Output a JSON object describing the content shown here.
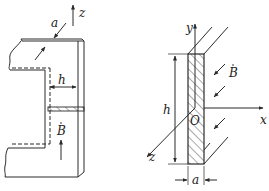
{
  "figure_left": {
    "labels": {
      "thickness": "a",
      "gap_width": "h",
      "field": "B",
      "axis_z": "z"
    },
    "description": "Magnetic core with air gap; hatched cross-section across right limb"
  },
  "figure_right": {
    "labels": {
      "axis_y": "y",
      "axis_x": "x",
      "axis_z": "z",
      "origin": "O",
      "height": "h",
      "width": "a",
      "field": "B"
    },
    "description": "Cross-section of plate of height h and thickness a with field B along z"
  },
  "colors": {
    "line": "#2a2a2a",
    "background": "#ffffff"
  }
}
